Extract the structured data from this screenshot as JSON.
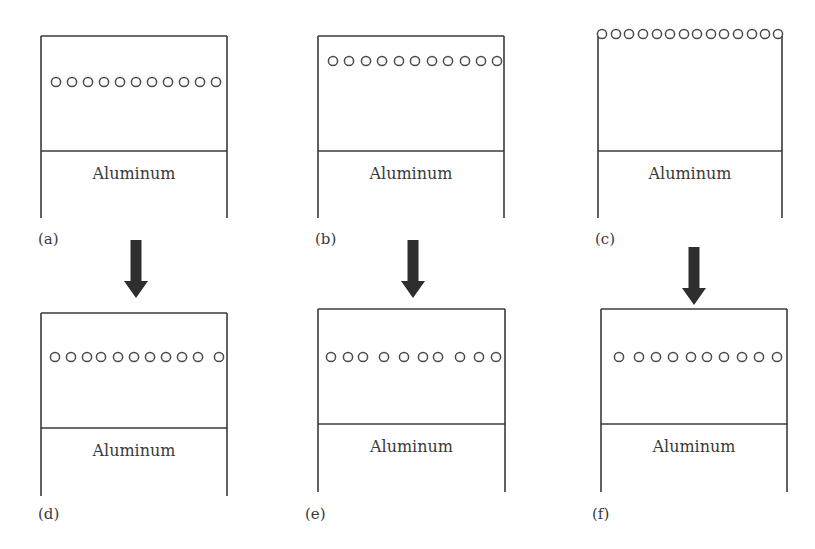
{
  "figure": {
    "line_color": "#3a3a3a",
    "arrow_color": "#2e2e2e",
    "circle_color": "#4a4a4a",
    "panels": [
      {
        "id": "a",
        "label": "(a)",
        "material": "Aluminum",
        "box": {
          "x": 41,
          "top": 36,
          "width": 186,
          "divider": 151,
          "bottom": 218
        },
        "label_pos": {
          "x": 38,
          "y": 246
        },
        "circles": {
          "y": 82,
          "r": 4.6,
          "xs": [
            56,
            72,
            88,
            104,
            120,
            136,
            152,
            168,
            184,
            200,
            216
          ]
        }
      },
      {
        "id": "b",
        "label": "(b)",
        "material": "Aluminum",
        "box": {
          "x": 318,
          "top": 36,
          "width": 186,
          "divider": 151,
          "bottom": 218
        },
        "label_pos": {
          "x": 315,
          "y": 246
        },
        "circles": {
          "y": 61,
          "r": 4.6,
          "xs": [
            333,
            349,
            366,
            382,
            399,
            415,
            432,
            448,
            465,
            481,
            497
          ]
        }
      },
      {
        "id": "c",
        "label": "(c)",
        "material": "Aluminum",
        "box": {
          "x": 598,
          "top": 36,
          "width": 184,
          "divider": 151,
          "bottom": 218
        },
        "label_pos": {
          "x": 595,
          "y": 246
        },
        "top_open": true,
        "circles": {
          "y": 34,
          "r": 4.6,
          "xs": [
            602,
            616,
            629,
            643,
            657,
            670,
            684,
            697,
            711,
            724,
            738,
            752,
            765,
            778
          ]
        }
      },
      {
        "id": "d",
        "label": "(d)",
        "material": "Aluminum",
        "box": {
          "x": 41,
          "top": 313,
          "width": 186,
          "divider": 428,
          "bottom": 496
        },
        "label_pos": {
          "x": 38,
          "y": 521
        },
        "circles": {
          "y": 357,
          "r": 4.6,
          "xs": [
            55,
            71,
            87,
            101,
            118,
            134,
            150,
            166,
            182,
            198,
            219
          ]
        }
      },
      {
        "id": "e",
        "label": "(e)",
        "material": "Aluminum",
        "box": {
          "x": 318,
          "top": 309,
          "width": 187,
          "divider": 424,
          "bottom": 492
        },
        "label_pos": {
          "x": 305,
          "y": 521
        },
        "circles": {
          "y": 357,
          "r": 4.6,
          "xs": [
            331,
            348,
            363,
            384,
            404,
            423,
            438,
            460,
            479,
            496
          ]
        }
      },
      {
        "id": "f",
        "label": "(f)",
        "material": "Aluminum",
        "box": {
          "x": 601,
          "top": 309,
          "width": 186,
          "divider": 424,
          "bottom": 492
        },
        "label_pos": {
          "x": 592,
          "y": 521
        },
        "circles": {
          "y": 357,
          "r": 4.6,
          "xs": [
            619,
            639,
            656,
            673,
            691,
            707,
            724,
            742,
            759,
            777
          ]
        }
      }
    ],
    "arrows": [
      {
        "id": "a-to-d",
        "x": 136,
        "top": 240,
        "bottom": 298
      },
      {
        "id": "b-to-e",
        "x": 413,
        "top": 240,
        "bottom": 298
      },
      {
        "id": "c-to-f",
        "x": 694,
        "top": 247,
        "bottom": 305
      }
    ]
  }
}
